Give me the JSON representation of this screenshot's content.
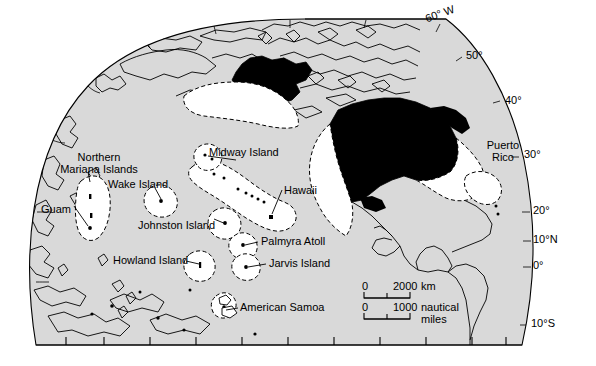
{
  "map": {
    "title": "United States Pacific Ocean territories and exclusive economic zones",
    "projection": "orthographic-globe",
    "colors": {
      "ocean": "#d9d9d9",
      "eez_fill": "#ffffff",
      "us_land": "#000000",
      "other_land": "#d9d9d9",
      "outline": "#000000",
      "page_background": "#ffffff"
    },
    "graticule_labels": [
      {
        "name": "lon-60w",
        "text": "60° W",
        "x": 424,
        "y": 16,
        "rotate": -22
      },
      {
        "name": "lat-50",
        "text": "50°",
        "x": 466,
        "y": 52,
        "rotate": 0
      },
      {
        "name": "lat-40",
        "text": "40°",
        "x": 506,
        "y": 96,
        "rotate": 0
      },
      {
        "name": "lat-30",
        "text": "30°",
        "x": 525,
        "y": 150,
        "rotate": 0
      },
      {
        "name": "lat-20",
        "text": "20°",
        "x": 534,
        "y": 207,
        "rotate": 0
      },
      {
        "name": "lat-10n",
        "text": "10°N",
        "x": 534,
        "y": 237,
        "rotate": 0
      },
      {
        "name": "lat-0",
        "text": "0°",
        "x": 534,
        "y": 263,
        "rotate": 0
      },
      {
        "name": "lat-10s",
        "text": "10°S",
        "x": 532,
        "y": 321,
        "rotate": 0
      }
    ],
    "place_labels": [
      {
        "name": "northern-mariana-islands",
        "text": "Northern\nMariana Islands",
        "x": 39,
        "y": 152,
        "align": "center"
      },
      {
        "name": "guam",
        "text": "Guam",
        "x": 41,
        "y": 204,
        "align": "left"
      },
      {
        "name": "wake-island",
        "text": "Wake Island",
        "x": 108,
        "y": 180,
        "align": "left"
      },
      {
        "name": "johnston-island",
        "text": "Johnston Island",
        "x": 138,
        "y": 222,
        "align": "left"
      },
      {
        "name": "midway-island",
        "text": "Midway Island",
        "x": 209,
        "y": 148,
        "align": "left"
      },
      {
        "name": "hawaii",
        "text": "Hawaii",
        "x": 284,
        "y": 187,
        "align": "left"
      },
      {
        "name": "palmyra-atoll",
        "text": "Palmyra Atoll",
        "x": 261,
        "y": 241,
        "align": "left"
      },
      {
        "name": "jarvis-island",
        "text": "Jarvis Island",
        "x": 269,
        "y": 263,
        "align": "left"
      },
      {
        "name": "howland-island",
        "text": "Howland Island",
        "x": 113,
        "y": 258,
        "align": "left"
      },
      {
        "name": "american-samoa",
        "text": "American Samoa",
        "x": 240,
        "y": 306,
        "align": "left"
      },
      {
        "name": "puerto-rico",
        "text": "Puerto\nRico",
        "x": 482,
        "y": 140,
        "align": "center"
      }
    ],
    "scale_bar": {
      "km": {
        "zero": "0",
        "max": "2000",
        "unit": "km"
      },
      "nautical": {
        "zero": "0",
        "max": "1000",
        "unit": "nautical\nmiles"
      }
    }
  }
}
